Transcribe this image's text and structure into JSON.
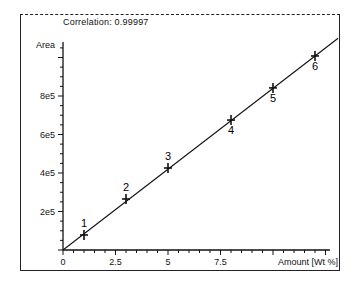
{
  "chart_data": {
    "type": "scatter",
    "title": "Correlation: 0.99997",
    "xlabel": "Amount [Wt %]",
    "ylabel": "Area",
    "xlim": [
      0,
      12.8
    ],
    "ylim": [
      0,
      1080000
    ],
    "x_ticks": [
      0,
      2.5,
      5,
      7.5
    ],
    "x_tick_labels": [
      "0",
      "2.5",
      "5",
      "7.5"
    ],
    "y_ticks": [
      200000,
      400000,
      600000,
      800000
    ],
    "y_tick_labels": [
      "2e5",
      "4e5",
      "6e5",
      "8e5"
    ],
    "grid": false,
    "legend": null,
    "series": [
      {
        "name": "calibration points",
        "marker": "+",
        "points": [
          {
            "label": "1",
            "x": 1.0,
            "y": 78000
          },
          {
            "label": "2",
            "x": 3.0,
            "y": 265000
          },
          {
            "label": "3",
            "x": 5.0,
            "y": 426000
          },
          {
            "label": "4",
            "x": 8.0,
            "y": 675000
          },
          {
            "label": "5",
            "x": 10.0,
            "y": 842000
          },
          {
            "label": "6",
            "x": 12.0,
            "y": 1008000
          }
        ]
      },
      {
        "name": "regression line",
        "type": "line",
        "x": [
          0,
          13.1
        ],
        "y": [
          0,
          1100000
        ]
      }
    ]
  },
  "labels": {
    "title": "Correlation: 0.99997",
    "y_axis": "Area",
    "x_axis": "Amount [Wt %]"
  }
}
